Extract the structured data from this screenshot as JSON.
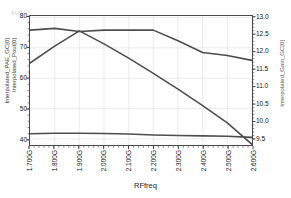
{
  "chart_data": {
    "type": "line",
    "title": "",
    "watermark": "AUC",
    "xlabel": "RFfreq",
    "ylabel_left_line1": "Interpolated_PAE_GC[0]",
    "ylabel_left_line2": "Interpolated_Pout[0]",
    "ylabel_right": "Interpolated_Gain_GC[0]",
    "grid": true,
    "legend": "none",
    "x": [
      1.7,
      1.8,
      1.9,
      2.0,
      2.1,
      2.2,
      2.3,
      2.4,
      2.5,
      2.6
    ],
    "x_tick_labels": [
      "1.700G",
      "1.800G",
      "1.900G",
      "2.000G",
      "2.100G",
      "2.200G",
      "2.300G",
      "2.400G",
      "2.500G",
      "2.600G"
    ],
    "xlim": [
      1.7,
      2.6
    ],
    "ylim_left": [
      38.0,
      80.5
    ],
    "y_left_ticks": [
      80,
      70,
      60,
      50,
      40
    ],
    "ylim_right": [
      9.3,
      13.05
    ],
    "y_right_ticks": [
      13.0,
      12.5,
      12.0,
      11.5,
      11.0,
      10.5,
      10.0,
      9.5
    ],
    "series": [
      {
        "name": "Interpolated_Gain_GC[0]",
        "axis": "right",
        "color": "#4d4d4d",
        "values": [
          12.64,
          12.69,
          12.6,
          12.64,
          12.64,
          12.64,
          12.33,
          11.99,
          11.9,
          11.76
        ]
      },
      {
        "name": "Interpolated_PAE_GC[0]",
        "axis": "left",
        "color": "#4d4d4d",
        "values": [
          65.0,
          70.6,
          75.6,
          71.3,
          66.6,
          61.6,
          56.4,
          51.0,
          45.3,
          38.2
        ]
      },
      {
        "name": "Interpolated_Pout[0]",
        "axis": "left",
        "color": "#4d4d4d",
        "values": [
          41.7,
          41.9,
          41.9,
          41.8,
          41.6,
          41.3,
          41.1,
          41.0,
          40.9,
          40.5
        ]
      }
    ]
  }
}
